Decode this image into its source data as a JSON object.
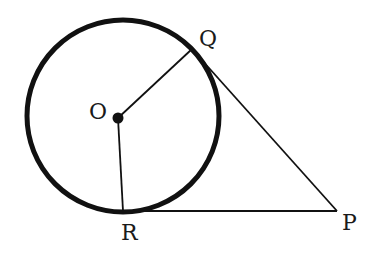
{
  "diagram": {
    "type": "geometry",
    "colors": {
      "stroke": "#111111",
      "background": "#ffffff"
    },
    "circle": {
      "cx": 123,
      "cy": 116,
      "r": 96,
      "stroke_width": 5
    },
    "points": {
      "O": {
        "label": "O",
        "x": 118,
        "y": 118
      },
      "Q": {
        "label": "Q",
        "x": 192,
        "y": 49
      },
      "R": {
        "label": "R",
        "x": 123,
        "y": 211
      },
      "P": {
        "label": "P",
        "x": 337,
        "y": 211
      }
    },
    "segments": [
      {
        "from": "O",
        "to": "Q",
        "label": "radius OQ"
      },
      {
        "from": "O",
        "to": "R",
        "label": "radius OR"
      },
      {
        "from": "Q",
        "to": "P",
        "label": "tangent QP"
      },
      {
        "from": "R",
        "to": "P",
        "label": "tangent RP"
      }
    ],
    "labels": {
      "O": "O",
      "Q": "Q",
      "R": "R",
      "P": "P"
    }
  }
}
